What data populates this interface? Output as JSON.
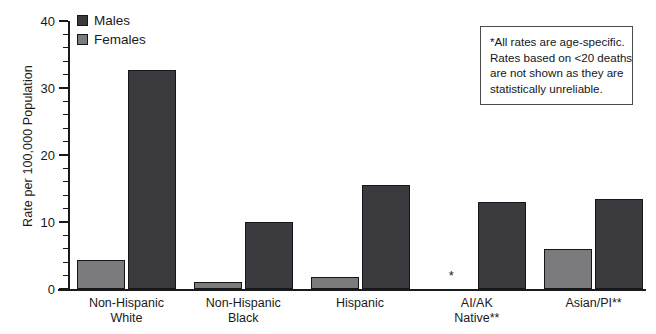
{
  "chart_data": {
    "type": "bar",
    "title": "",
    "xlabel": "",
    "ylabel": "Rate per 100,000 Population",
    "ylim": [
      0,
      40
    ],
    "ytick_labels": [
      "0",
      "10",
      "20",
      "30",
      "40"
    ],
    "ytick_values": [
      0,
      10,
      20,
      30,
      40
    ],
    "minor_tick_interval": 2,
    "grid": false,
    "legend_position": "top-left",
    "categories": [
      "Non-Hispanic White",
      "Non-Hispanic Black",
      "Hispanic",
      "AI/AK Native**",
      "Asian/PI**"
    ],
    "category_lines": [
      [
        "Non-Hispanic",
        "White"
      ],
      [
        "Non-Hispanic",
        "Black"
      ],
      [
        "Hispanic"
      ],
      [
        "AI/AK",
        "Native**"
      ],
      [
        "Asian/PI**"
      ]
    ],
    "series": [
      {
        "name": "Females",
        "color": "#7b7b7e",
        "values": [
          4.3,
          1.0,
          1.8,
          null,
          5.9
        ]
      },
      {
        "name": "Males",
        "color": "#3b3b3f",
        "values": [
          32.7,
          10.0,
          15.5,
          13.0,
          13.4
        ]
      }
    ],
    "suppressed_marker": "*",
    "suppressed_points": [
      {
        "category": "AI/AK Native**",
        "series": "Females"
      }
    ],
    "annotations": [
      "*All rates are age-specific.",
      "Rates based on <20 deaths",
      "are not shown as they are",
      "statistically unreliable."
    ]
  },
  "legend": {
    "items": [
      {
        "label": "Males",
        "color": "#3b3b3f"
      },
      {
        "label": "Females",
        "color": "#7b7b7e"
      }
    ]
  },
  "colors": {
    "male": "#3b3b3f",
    "female": "#7b7b7e",
    "axis": "#1a1a1a",
    "background": "#ffffff",
    "note_border": "#4a4a4a"
  }
}
